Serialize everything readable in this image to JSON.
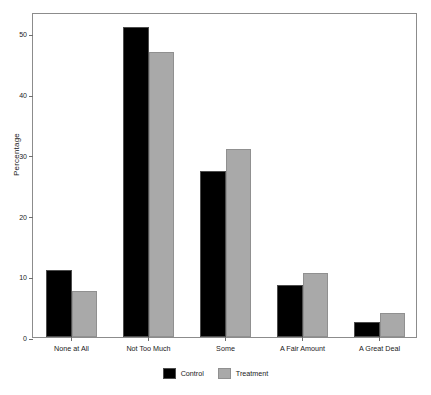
{
  "chart_data": {
    "type": "bar",
    "title": "",
    "xlabel": "",
    "ylabel": "Percentage",
    "categories": [
      "None at All",
      "Not Too Much",
      "Some",
      "A Fair Amount",
      "A Great Deal"
    ],
    "series": [
      {
        "name": "Control",
        "color": "#000000",
        "values": [
          11.0,
          51.0,
          27.4,
          8.6,
          2.4
        ]
      },
      {
        "name": "Treatment",
        "color": "#a9a9a9",
        "values": [
          7.6,
          47.0,
          31.0,
          10.5,
          4.0
        ]
      }
    ],
    "ylim": [
      0,
      53.5
    ],
    "yticks": [
      0,
      10,
      20,
      30,
      40,
      50
    ],
    "ytick_labels": [
      "0",
      "10",
      "20",
      "30",
      "40",
      "50"
    ],
    "grid": false,
    "legend_position": "bottom-center",
    "frame": true,
    "background": "#ffffff"
  }
}
